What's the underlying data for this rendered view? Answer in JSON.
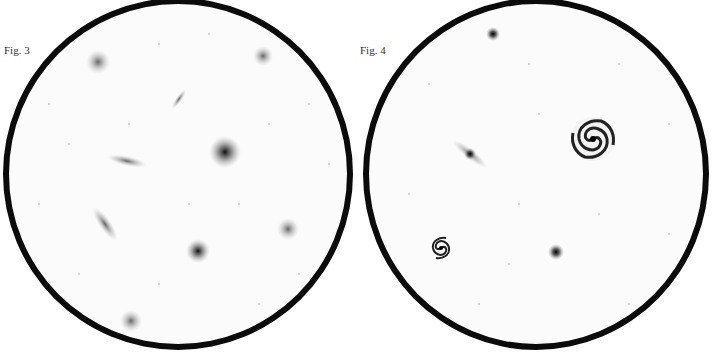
{
  "figures": [
    {
      "label": "Fig. 3",
      "objects": [
        {
          "type": "cluster",
          "x": 95,
          "y": 58
        },
        {
          "type": "cluster",
          "x": 260,
          "y": 52
        },
        {
          "type": "edge-on-galaxy",
          "x": 175,
          "y": 95
        },
        {
          "type": "elliptical-galaxy",
          "x": 222,
          "y": 148
        },
        {
          "type": "edge-on-galaxy",
          "x": 123,
          "y": 157
        },
        {
          "type": "edge-on-galaxy",
          "x": 100,
          "y": 218
        },
        {
          "type": "cluster",
          "x": 285,
          "y": 225
        },
        {
          "type": "elliptical-galaxy",
          "x": 195,
          "y": 247
        },
        {
          "type": "cluster",
          "x": 128,
          "y": 317
        }
      ]
    },
    {
      "label": "Fig. 4",
      "objects": [
        {
          "type": "star-cluster",
          "x": 493,
          "y": 30
        },
        {
          "type": "edge-on-galaxy",
          "x": 470,
          "y": 148
        },
        {
          "type": "spiral-galaxy",
          "x": 593,
          "y": 135
        },
        {
          "type": "spiral-galaxy",
          "x": 441,
          "y": 244
        },
        {
          "type": "star-cluster",
          "x": 556,
          "y": 248
        }
      ]
    }
  ]
}
